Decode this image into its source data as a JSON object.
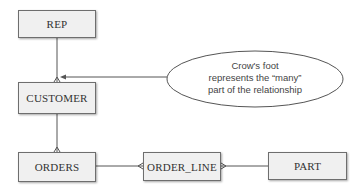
{
  "diagram": {
    "type": "entity-relationship",
    "entities": [
      {
        "id": "rep",
        "label": "REP"
      },
      {
        "id": "customer",
        "label": "CUSTOMER"
      },
      {
        "id": "orders",
        "label": "ORDERS"
      },
      {
        "id": "order_line",
        "label": "ORDER_LINE"
      },
      {
        "id": "part",
        "label": "PART"
      }
    ],
    "relationships": [
      {
        "from": "rep",
        "to": "customer",
        "many_end": "customer"
      },
      {
        "from": "customer",
        "to": "orders",
        "many_end": "orders"
      },
      {
        "from": "orders",
        "to": "order_line",
        "many_end": "order_line"
      },
      {
        "from": "part",
        "to": "order_line",
        "many_end": "order_line"
      }
    ],
    "callout": {
      "line1": "Crow's foot",
      "line2": "represents the “many”",
      "line3": "part of the relationship",
      "points_to": "customer"
    },
    "colors": {
      "entity_fill": "#f0f0f0",
      "entity_border": "#6e6e6e",
      "line": "#555555"
    }
  }
}
